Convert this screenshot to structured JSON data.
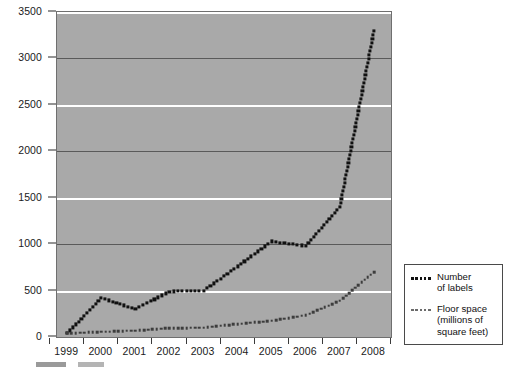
{
  "chart_data": {
    "type": "line",
    "title": "",
    "subtitle": "",
    "xlabel": "",
    "ylabel": "",
    "x": [
      1999,
      2000,
      2001,
      2002,
      2003,
      2004,
      2005,
      2006,
      2007,
      2008
    ],
    "categories": [
      "1999",
      "2000",
      "2001",
      "2002",
      "2003",
      "2004",
      "2005",
      "2006",
      "2007",
      "2008"
    ],
    "xlim": [
      1998.7,
      2008.5
    ],
    "ylim": [
      0,
      3500
    ],
    "y_ticks": [
      0,
      500,
      1000,
      1500,
      2000,
      2500,
      3000,
      3500
    ],
    "y_tick_labels": [
      "0",
      "500",
      "1000",
      "1500",
      "2000",
      "2500",
      "3000",
      "3500"
    ],
    "grid": true,
    "grid_note": "horizontal gridlines only; 500/1500/2500 drawn white, 1000/2000/3000 drawn dark",
    "legend_position": "right-outside-bottom",
    "plot_background": "#a9a9a9",
    "series": [
      {
        "name": "Number of labels",
        "color": "#111111",
        "style": "dotted",
        "values": [
          40,
          420,
          300,
          490,
          500,
          760,
          1030,
          980,
          1400,
          3300
        ]
      },
      {
        "name": "Floor space (millions of square feet)",
        "color": "#3d3d3d",
        "style": "dotted",
        "values": [
          40,
          55,
          70,
          95,
          100,
          140,
          175,
          235,
          390,
          700
        ]
      }
    ]
  },
  "legend": {
    "entries": [
      {
        "label": "Number\nof labels",
        "line1": "Number",
        "line2": "of labels",
        "marker": "dotted-dark"
      },
      {
        "label": "Floor space\n(millions of\nsquare feet)",
        "line1": "Floor space",
        "line2": "(millions of",
        "line3": "square feet)",
        "marker": "dotted-gray"
      }
    ]
  },
  "caption": {
    "text": ""
  },
  "colors": {
    "plot_bg": "#a9a9a9",
    "grid_light": "#ffffff",
    "grid_dark": "#5a5a5a",
    "series_1": "#111111",
    "series_2": "#3d3d3d",
    "axis_text": "#1a1a1a",
    "page_bg": "#ffffff"
  }
}
